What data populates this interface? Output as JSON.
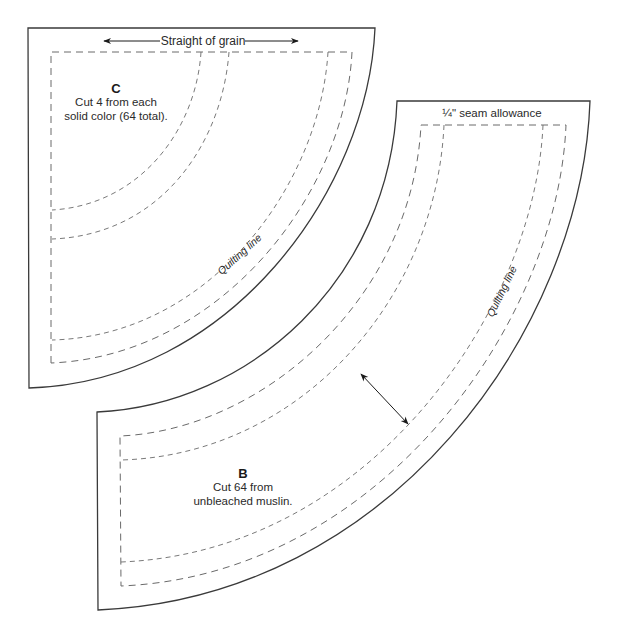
{
  "diagram": {
    "type": "quilt-template",
    "colors": {
      "piece_c_fill": "#f1f1f1",
      "piece_b_fill": "#ffffff",
      "outline": "#3a3a3a",
      "dashes": "#6a6a6a"
    },
    "piece_c": {
      "letter": "C",
      "line1": "Cut 4 from each",
      "line2": "solid color (64 total).",
      "grain_label": "Straight of grain",
      "quilting_label": "Quilting line"
    },
    "piece_b": {
      "letter": "B",
      "line1": "Cut 64 from",
      "line2": "unbleached muslin.",
      "seam_label": "¼\" seam allowance",
      "quilting_label": "Quilting line"
    }
  }
}
